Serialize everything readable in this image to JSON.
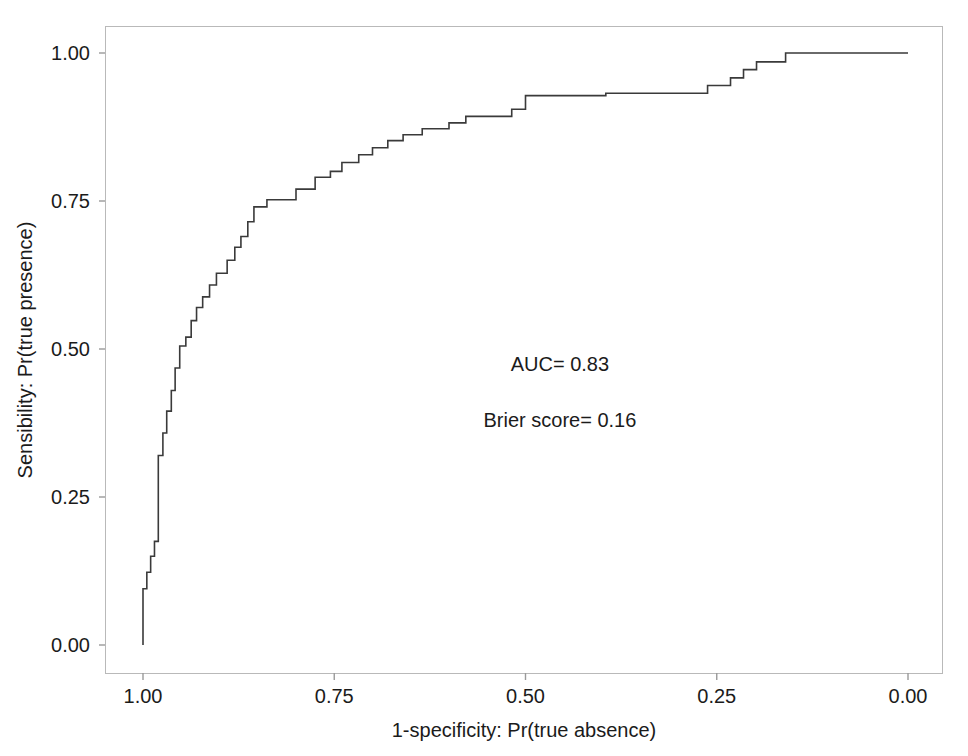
{
  "chart_data": {
    "type": "line",
    "title": "",
    "subtitle": "",
    "xlabel": "1-specificity: Pr(true absence)",
    "ylabel": "Sensibility: Pr(true presence)",
    "xlim": [
      1.0,
      0.0
    ],
    "ylim": [
      0.0,
      1.0
    ],
    "x_axis_reversed": true,
    "grid": false,
    "legend": null,
    "legend_position": "none",
    "xticks": [
      "1.00",
      "0.75",
      "0.50",
      "0.25",
      "0.00"
    ],
    "xtick_values": [
      1.0,
      0.75,
      0.5,
      0.25,
      0.0
    ],
    "yticks": [
      "0.00",
      "0.25",
      "0.50",
      "0.75",
      "1.00"
    ],
    "ytick_values": [
      0.0,
      0.25,
      0.5,
      0.75,
      1.0
    ],
    "line_color": "#3a3a3a",
    "series": [
      {
        "name": "ROC curve",
        "step": "post",
        "points": [
          [
            1.0,
            0.0
          ],
          [
            1.0,
            0.095
          ],
          [
            0.995,
            0.095
          ],
          [
            0.995,
            0.123
          ],
          [
            0.99,
            0.123
          ],
          [
            0.99,
            0.15
          ],
          [
            0.985,
            0.15
          ],
          [
            0.985,
            0.175
          ],
          [
            0.98,
            0.175
          ],
          [
            0.98,
            0.32
          ],
          [
            0.974,
            0.32
          ],
          [
            0.974,
            0.358
          ],
          [
            0.969,
            0.358
          ],
          [
            0.969,
            0.395
          ],
          [
            0.963,
            0.395
          ],
          [
            0.963,
            0.43
          ],
          [
            0.958,
            0.43
          ],
          [
            0.958,
            0.468
          ],
          [
            0.952,
            0.468
          ],
          [
            0.952,
            0.505
          ],
          [
            0.944,
            0.505
          ],
          [
            0.944,
            0.52
          ],
          [
            0.937,
            0.52
          ],
          [
            0.937,
            0.548
          ],
          [
            0.93,
            0.548
          ],
          [
            0.93,
            0.57
          ],
          [
            0.922,
            0.57
          ],
          [
            0.922,
            0.588
          ],
          [
            0.913,
            0.588
          ],
          [
            0.913,
            0.608
          ],
          [
            0.904,
            0.608
          ],
          [
            0.904,
            0.628
          ],
          [
            0.89,
            0.628
          ],
          [
            0.89,
            0.65
          ],
          [
            0.88,
            0.65
          ],
          [
            0.88,
            0.672
          ],
          [
            0.872,
            0.672
          ],
          [
            0.872,
            0.69
          ],
          [
            0.863,
            0.69
          ],
          [
            0.863,
            0.715
          ],
          [
            0.855,
            0.715
          ],
          [
            0.855,
            0.74
          ],
          [
            0.838,
            0.74
          ],
          [
            0.838,
            0.752
          ],
          [
            0.8,
            0.752
          ],
          [
            0.8,
            0.77
          ],
          [
            0.775,
            0.77
          ],
          [
            0.775,
            0.79
          ],
          [
            0.755,
            0.79
          ],
          [
            0.755,
            0.8
          ],
          [
            0.74,
            0.8
          ],
          [
            0.74,
            0.815
          ],
          [
            0.718,
            0.815
          ],
          [
            0.718,
            0.828
          ],
          [
            0.7,
            0.828
          ],
          [
            0.7,
            0.84
          ],
          [
            0.68,
            0.84
          ],
          [
            0.68,
            0.852
          ],
          [
            0.66,
            0.852
          ],
          [
            0.66,
            0.862
          ],
          [
            0.635,
            0.862
          ],
          [
            0.635,
            0.872
          ],
          [
            0.6,
            0.872
          ],
          [
            0.6,
            0.882
          ],
          [
            0.578,
            0.882
          ],
          [
            0.578,
            0.893
          ],
          [
            0.518,
            0.893
          ],
          [
            0.518,
            0.905
          ],
          [
            0.5,
            0.905
          ],
          [
            0.5,
            0.928
          ],
          [
            0.395,
            0.928
          ],
          [
            0.395,
            0.932
          ],
          [
            0.262,
            0.932
          ],
          [
            0.262,
            0.945
          ],
          [
            0.232,
            0.945
          ],
          [
            0.232,
            0.958
          ],
          [
            0.215,
            0.958
          ],
          [
            0.215,
            0.972
          ],
          [
            0.198,
            0.972
          ],
          [
            0.198,
            0.985
          ],
          [
            0.16,
            0.985
          ],
          [
            0.16,
            1.0
          ],
          [
            0.0,
            1.0
          ]
        ]
      }
    ],
    "annotations": [
      {
        "id": "auc",
        "text": "AUC= 0.83",
        "x": 0.455,
        "y": 0.463
      },
      {
        "id": "brier",
        "text": "Brier score= 0.16",
        "x": 0.455,
        "y": 0.368
      }
    ]
  },
  "figure": {
    "background_color": "#ffffff",
    "frame_color": "#b8b8b8",
    "tick_color": "#9a9a9a",
    "text_color": "#1b1b1b"
  }
}
